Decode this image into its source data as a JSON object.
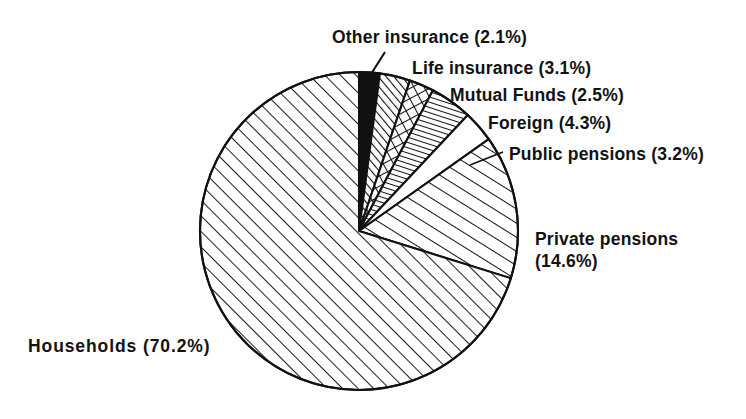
{
  "chart_data": {
    "type": "pie",
    "title": "",
    "subtitle": "",
    "xlabel": "",
    "ylabel": "",
    "legend_position": "callout-labels",
    "grid": false,
    "units": "percent",
    "start_angle_deg": 0,
    "direction": "clockwise",
    "center": {
      "x": 359,
      "y": 231
    },
    "radius": 159,
    "categories": [
      "Other insurance",
      "Life insurance",
      "Mutual Funds",
      "Foreign",
      "Public pensions",
      "Private pensions",
      "Households"
    ],
    "values": [
      2.1,
      3.1,
      2.5,
      4.3,
      3.2,
      14.6,
      70.2
    ],
    "slices": [
      {
        "name": "Other insurance",
        "value": 2.1,
        "label": "Other insurance (2.1%)",
        "percent_text": "(2.1%)",
        "fill": "solid-black",
        "color": "#111111",
        "leader_line": true
      },
      {
        "name": "Life insurance",
        "value": 3.1,
        "label": "Life insurance (3.1%)",
        "percent_text": "(3.1%)",
        "fill": "dense-diagonal-hatch",
        "color": "#111111",
        "leader_line": false
      },
      {
        "name": "Mutual Funds",
        "value": 2.5,
        "label": "Mutual Funds (2.5%)",
        "percent_text": "(2.5%)",
        "fill": "crosshatch-diamond",
        "color": "#111111",
        "leader_line": false
      },
      {
        "name": "Foreign",
        "value": 4.3,
        "label": "Foreign (4.3%)",
        "percent_text": "(4.3%)",
        "fill": "fine-parallel-lines",
        "color": "#111111",
        "leader_line": false
      },
      {
        "name": "Public pensions",
        "value": 3.2,
        "label": "Public pensions (3.2%)",
        "percent_text": "(3.2%)",
        "fill": "none-white",
        "color": "#ffffff",
        "leader_line": false
      },
      {
        "name": "Private pensions",
        "value": 14.6,
        "label": "Private pensions (14.6%)",
        "label_line1": "Private pensions",
        "label_line2": "(14.6%)",
        "percent_text": "(14.6%)",
        "fill": "wide-diagonal-hatch",
        "color": "#111111",
        "leader_line": false
      },
      {
        "name": "Households",
        "value": 70.2,
        "label": "Households (70.2%)",
        "percent_text": "(70.2%)",
        "fill": "diagonal-hatch-45",
        "color": "#111111",
        "leader_line": false
      }
    ]
  },
  "labels": {
    "other_insurance": "Other insurance (2.1%)",
    "life_insurance": "Life insurance (3.1%)",
    "mutual_funds": "Mutual Funds (2.5%)",
    "foreign": "Foreign (4.3%)",
    "public_pensions": "Public pensions (3.2%)",
    "private_pensions_line1": "Private pensions",
    "private_pensions_line2": "(14.6%)",
    "households": "Households (70.2%)"
  },
  "colors": {
    "background": "#ffffff",
    "ink": "#111111",
    "outline": "#111111"
  }
}
